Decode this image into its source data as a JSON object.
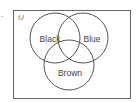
{
  "diagram": {
    "type": "venn",
    "marker": ".",
    "universe_label": "U",
    "sets": [
      {
        "name": "Black",
        "cx": 55,
        "cy": 38,
        "r": 25
      },
      {
        "name": "Blue",
        "cx": 83,
        "cy": 38,
        "r": 25
      },
      {
        "name": "Brown",
        "cx": 69,
        "cy": 65,
        "r": 25
      }
    ],
    "colors": {
      "stroke": "#555555",
      "text": "#444444",
      "background": "#ffffff"
    }
  }
}
